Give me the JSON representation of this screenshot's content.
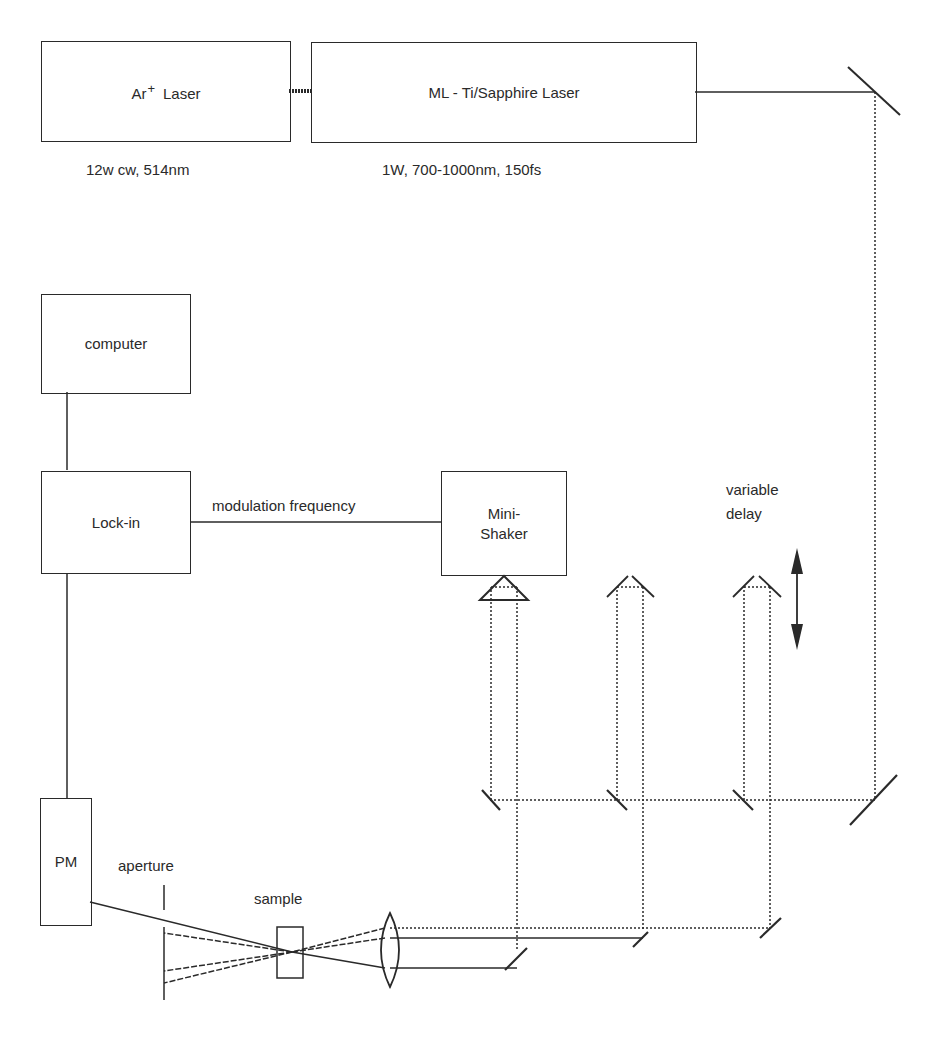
{
  "diagram": {
    "type": "optical-setup-schematic",
    "components": {
      "ar_laser": {
        "label_main": "Ar",
        "label_sup": "+",
        "label_rest": "Laser",
        "spec": "12w cw, 514nm"
      },
      "ti_sapphire_laser": {
        "label": "ML - Ti/Sapphire Laser",
        "spec": "1W, 700-1000nm, 150fs"
      },
      "computer": {
        "label": "computer"
      },
      "lock_in": {
        "label": "Lock-in"
      },
      "mini_shaker": {
        "line1": "Mini-",
        "line2": "Shaker"
      },
      "pm": {
        "label": "PM"
      },
      "aperture": {
        "label": "aperture"
      },
      "sample": {
        "label": "sample"
      },
      "variable_delay": {
        "line1": "variable",
        "line2": "delay"
      }
    },
    "connections": {
      "lockin_to_shaker": "modulation frequency"
    },
    "colors": {
      "line": "#2a2a2a",
      "background": "#ffffff"
    }
  }
}
